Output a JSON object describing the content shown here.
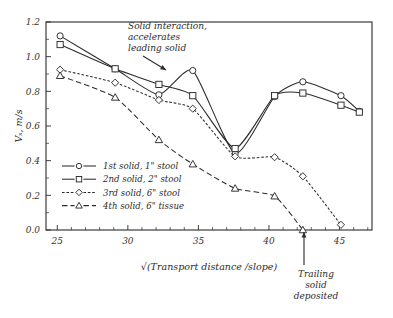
{
  "chart_data": {
    "type": "line",
    "title": "",
    "xlabel": "√(Transport distance /slope)",
    "ylabel": "Vₛ, m/s",
    "xlim": [
      24.2,
      47.3
    ],
    "ylim": [
      0.0,
      1.2
    ],
    "xticks": [
      25,
      30,
      35,
      40,
      45
    ],
    "yticks": [
      "0.0",
      "0.2",
      "0.4",
      "0.6",
      "0.8",
      "1.0",
      "1.2"
    ],
    "grid": false,
    "legend_position": "lower-left-inside",
    "series": [
      {
        "name": "1st solid, 1\" stool",
        "marker": "circle",
        "dash": "solid",
        "x": [
          25.2,
          29.1,
          32.2,
          34.6,
          37.6,
          40.4,
          42.4,
          45.1,
          46.4
        ],
        "y": [
          1.12,
          0.93,
          0.78,
          0.92,
          0.44,
          0.77,
          0.855,
          0.775,
          0.685
        ]
      },
      {
        "name": "2nd solid, 2\" stool",
        "marker": "square",
        "dash": "solid-thin",
        "x": [
          25.2,
          29.1,
          32.2,
          34.6,
          37.6,
          40.4,
          42.4,
          45.1,
          46.4
        ],
        "y": [
          1.07,
          0.93,
          0.84,
          0.775,
          0.47,
          0.775,
          0.79,
          0.72,
          0.68
        ]
      },
      {
        "name": "3rd solid, 6\" stool",
        "marker": "diamond",
        "dash": "dotted",
        "x": [
          25.2,
          29.1,
          32.2,
          34.6,
          37.6,
          40.4,
          42.4,
          45.1
        ],
        "y": [
          0.925,
          0.85,
          0.75,
          0.7,
          0.425,
          0.42,
          0.31,
          0.03
        ]
      },
      {
        "name": "4th solid, 6\" tissue",
        "marker": "triangle",
        "dash": "dashed",
        "x": [
          25.2,
          29.1,
          32.2,
          34.6,
          37.6,
          40.4,
          42.4
        ],
        "y": [
          0.89,
          0.765,
          0.52,
          0.38,
          0.24,
          0.195,
          0.0
        ]
      }
    ],
    "annotations": [
      {
        "id": "solid-interaction",
        "lines": [
          "Solid interaction,",
          "accelerates",
          "leading solid"
        ],
        "text_x": 128,
        "text_y": 29,
        "arrow": {
          "x1": 143,
          "y1": 56,
          "x2": 166,
          "y2": 70
        }
      },
      {
        "id": "trailing-solid-deposited",
        "lines": [
          "Trailing",
          "solid",
          "deposited"
        ],
        "text_x": 316,
        "text_y": 277,
        "arrow": {
          "x1": 304,
          "y1": 265,
          "x2": 304,
          "y2": 232
        }
      }
    ]
  },
  "legend": {
    "items": [
      {
        "label": "1st solid, 1\" stool",
        "marker": "circle-icon",
        "dash": "solid"
      },
      {
        "label": "2nd solid, 2\" stool",
        "marker": "square-icon",
        "dash": "solid-thin"
      },
      {
        "label": "3rd solid, 6\" stool",
        "marker": "diamond-icon",
        "dash": "dotted"
      },
      {
        "label": "4th solid, 6\" tissue",
        "marker": "triangle-icon",
        "dash": "dashed"
      }
    ]
  },
  "colors": {
    "ink": "#2b2b2b",
    "background": "#ffffff",
    "marker_fill": "#ffffff"
  }
}
